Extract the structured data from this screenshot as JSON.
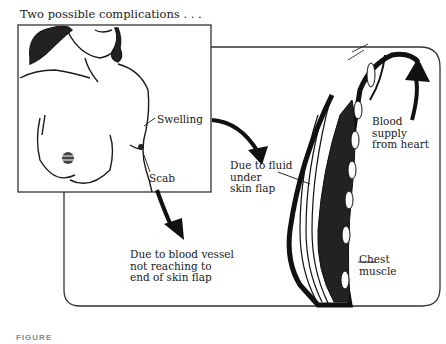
{
  "figure": {
    "title": "Two possible complications . . .",
    "caption_partial": "FIGURE"
  },
  "left_panel": {
    "labels": {
      "swelling": "Swelling",
      "scab": "Scab"
    }
  },
  "right_panel": {
    "labels": {
      "fluid": "Due to fluid\nunder\nskin flap",
      "blood_vessel": "Due to blood vessel\nnot reaching to\nend of skin flap",
      "blood_supply": "Blood\nsupply\nfrom heart",
      "chest_muscle": "Chest\nmuscle"
    }
  },
  "colors": {
    "ink": "#1a1a1a",
    "border": "#333333",
    "background": "#ffffff"
  }
}
